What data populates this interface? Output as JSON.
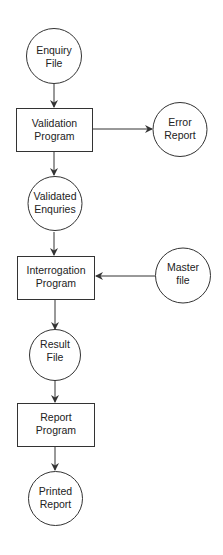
{
  "diagram": {
    "type": "system-flowchart",
    "colors": {
      "stroke": "#333333",
      "text": "#222222",
      "background": "#ffffff"
    },
    "nodes": {
      "enquiry_file": {
        "shape": "circle",
        "line1": "Enquiry",
        "line2": "File"
      },
      "validation_program": {
        "shape": "rectangle",
        "line1": "Validation",
        "line2": "Program"
      },
      "error_report": {
        "shape": "circle",
        "line1": "Error",
        "line2": "Report"
      },
      "validated_enquiries": {
        "shape": "circle",
        "line1": "Validated",
        "line2": "Enquries"
      },
      "interrogation_program": {
        "shape": "rectangle",
        "line1": "Interrogation",
        "line2": "Program"
      },
      "master_file": {
        "shape": "circle",
        "line1": "Master",
        "line2": "file"
      },
      "result_file": {
        "shape": "circle",
        "line1": "Result",
        "line2": "File"
      },
      "report_program": {
        "shape": "rectangle",
        "line1": "Report",
        "line2": "Program"
      },
      "printed_report": {
        "shape": "circle",
        "line1": "Printed",
        "line2": "Report"
      }
    },
    "edges": [
      {
        "from": "Enquiry File",
        "to": "Validation Program"
      },
      {
        "from": "Validation Program",
        "to": "Error Report"
      },
      {
        "from": "Validation Program",
        "to": "Validated Enquries"
      },
      {
        "from": "Validated Enquries",
        "to": "Interrogation Program"
      },
      {
        "from": "Master file",
        "to": "Interrogation Program"
      },
      {
        "from": "Interrogation Program",
        "to": "Result File"
      },
      {
        "from": "Result File",
        "to": "Report Program"
      },
      {
        "from": "Report Program",
        "to": "Printed Report"
      }
    ]
  }
}
